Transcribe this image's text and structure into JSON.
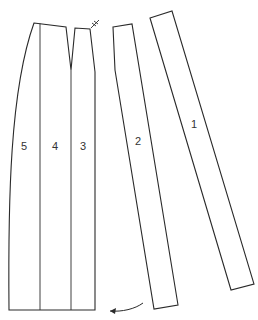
{
  "diagram": {
    "type": "sewing-pattern-pieces",
    "panels": [
      {
        "id": "panel-5",
        "label": "5"
      },
      {
        "id": "panel-4",
        "label": "4"
      },
      {
        "id": "panel-3",
        "label": "3"
      },
      {
        "id": "panel-2",
        "label": "2"
      },
      {
        "id": "panel-1",
        "label": "1"
      }
    ],
    "annotations": {
      "notch_mark": "‡",
      "arrow": "rotate-direction-arrow"
    },
    "colors": {
      "stroke": "#2a2a2a",
      "background": "#ffffff"
    }
  }
}
